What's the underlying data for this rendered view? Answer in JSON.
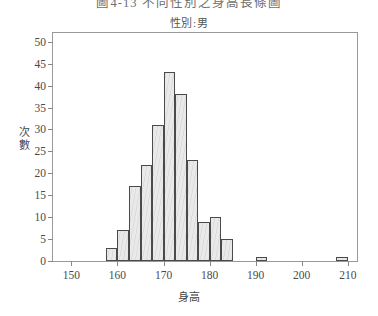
{
  "titles": {
    "main": "圖4-13  不同性別之身高長條圖",
    "sub": "性別:男"
  },
  "axis": {
    "ylabel": "次數",
    "xlabel": "身高",
    "yticks": [
      "0",
      "5",
      "10",
      "15",
      "20",
      "25",
      "30",
      "35",
      "40",
      "45",
      "50"
    ],
    "xticks": [
      "150",
      "160",
      "170",
      "180",
      "190",
      "200",
      "210"
    ]
  },
  "chart_data": {
    "type": "bar",
    "title": "圖4-13  不同性別之身高長條圖",
    "subtitle": "性別:男",
    "xlabel": "身高",
    "ylabel": "次數",
    "xlim": [
      146,
      212
    ],
    "ylim": [
      0,
      52
    ],
    "grid": false,
    "legend": null,
    "bin_width": 2.5,
    "bin_starts": [
      157.5,
      160.0,
      162.5,
      165.0,
      167.5,
      170.0,
      172.5,
      175.0,
      177.5,
      180.0,
      182.5,
      190.0,
      207.5
    ],
    "categories": [
      "157.5-160",
      "160-162.5",
      "162.5-165",
      "165-167.5",
      "167.5-170",
      "170-172.5",
      "172.5-175",
      "175-177.5",
      "177.5-180",
      "180-182.5",
      "182.5-185",
      "190-192.5",
      "207.5-210"
    ],
    "values": [
      3,
      7,
      17,
      22,
      31,
      43,
      38,
      23,
      9,
      10,
      5,
      1,
      1
    ],
    "xtick_values": [
      150,
      160,
      170,
      180,
      190,
      200,
      210
    ],
    "ytick_values": [
      0,
      5,
      10,
      15,
      20,
      25,
      30,
      35,
      40,
      45,
      50
    ]
  },
  "style": {
    "bar_fill": "#e9e9e9",
    "bar_stroke": "#4a4a4a",
    "frame": "#999999",
    "text": "#4a4a4a",
    "background": "#ffffff"
  }
}
